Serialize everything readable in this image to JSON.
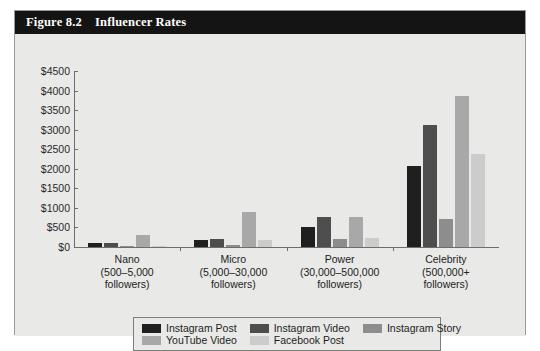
{
  "figure": {
    "number": "Figure 8.2",
    "title": "Influencer Rates"
  },
  "chart_data": {
    "type": "bar",
    "title": "Influencer Rates",
    "xlabel": "",
    "ylabel": "",
    "ylim": [
      0,
      4500
    ],
    "ytick_step": 500,
    "grid": false,
    "legend_position": "bottom",
    "categories": [
      "Nano\n(500–5,000 followers)",
      "Micro\n(5,000–30,000 followers)",
      "Power\n(30,000–500,000 followers)",
      "Celebrity\n(500,000+ followers)"
    ],
    "category_labels": [
      {
        "name": "Nano",
        "range": "(500–5,000",
        "unit": "followers)"
      },
      {
        "name": "Micro",
        "range": "(5,000–30,000",
        "unit": "followers)"
      },
      {
        "name": "Power",
        "range": "(30,000–500,000",
        "unit": "followers)"
      },
      {
        "name": "Celebrity",
        "range": "(500,000+",
        "unit": "followers)"
      }
    ],
    "ytick_labels": [
      "$4500",
      "$4000",
      "$3500",
      "$3000",
      "$2500",
      "$2000",
      "$1500",
      "$1000",
      "$500",
      "$0"
    ],
    "ytick_values": [
      4500,
      4000,
      3500,
      3000,
      2500,
      2000,
      1500,
      1000,
      500,
      0
    ],
    "series": [
      {
        "name": "Instagram Post",
        "color": "#201f1f",
        "values": [
          100,
          175,
          500,
          2075
        ]
      },
      {
        "name": "Instagram Video",
        "color": "#4e4e4e",
        "values": [
          105,
          210,
          775,
          3125
        ]
      },
      {
        "name": "Instagram Story",
        "color": "#8d8d8d",
        "values": [
          30,
          60,
          200,
          725
        ]
      },
      {
        "name": "YouTube Video",
        "color": "#a8a8a8",
        "values": [
          320,
          900,
          775,
          3850
        ]
      },
      {
        "name": "Facebook Post",
        "color": "#cccccc",
        "values": [
          10,
          170,
          220,
          2375
        ]
      }
    ]
  },
  "legend": {
    "entries": [
      {
        "label": "Instagram Post",
        "color": "#201f1f"
      },
      {
        "label": "Instagram Video",
        "color": "#4e4e4e"
      },
      {
        "label": "Instagram Story",
        "color": "#8d8d8d"
      },
      {
        "label": "YouTube Video",
        "color": "#a8a8a8"
      },
      {
        "label": "Facebook Post",
        "color": "#cccccc"
      }
    ]
  }
}
